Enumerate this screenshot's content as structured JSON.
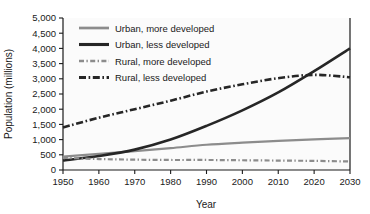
{
  "chart_data": {
    "type": "line",
    "title": "",
    "xlabel": "Year",
    "ylabel": "Population (millions)",
    "xlim": [
      1950,
      2030
    ],
    "ylim": [
      0,
      5000
    ],
    "xticks": [
      "1950",
      "1960",
      "1970",
      "1980",
      "1990",
      "2000",
      "2010",
      "2020",
      "2030"
    ],
    "yticks": [
      "0",
      "500",
      "1,000",
      "1,500",
      "2,000",
      "2,500",
      "3,000",
      "3,500",
      "4,000",
      "4,500",
      "5,000"
    ],
    "grid": false,
    "legend_position": "upper-left-inside",
    "x": [
      1950,
      1960,
      1970,
      1980,
      1990,
      2000,
      2010,
      2020,
      2030
    ],
    "series": [
      {
        "name": "Urban, more developed",
        "color": "#8c8c8c",
        "style": "solid",
        "width": 2.2,
        "values": [
          440,
          530,
          620,
          720,
          830,
          900,
          960,
          1010,
          1050
        ]
      },
      {
        "name": "Urban, less developed",
        "color": "#262626",
        "style": "solid",
        "width": 2.6,
        "values": [
          310,
          460,
          670,
          1000,
          1450,
          1960,
          2550,
          3250,
          4000
        ]
      },
      {
        "name": "Rural, more developed",
        "color": "#8c8c8c",
        "style": "dash-dot",
        "width": 2.2,
        "values": [
          400,
          360,
          340,
          330,
          330,
          320,
          310,
          300,
          280
        ]
      },
      {
        "name": "Rural, less developed",
        "color": "#262626",
        "style": "dash-dot",
        "width": 2.6,
        "values": [
          1400,
          1720,
          2000,
          2280,
          2580,
          2820,
          3020,
          3130,
          3050
        ]
      }
    ]
  },
  "legend": {
    "items": [
      {
        "label": "Urban, more developed"
      },
      {
        "label": "Urban, less developed"
      },
      {
        "label": "Rural, more developed"
      },
      {
        "label": "Rural, less developed"
      }
    ]
  },
  "axes": {
    "x_title": "Year",
    "y_title": "Population (millions)"
  }
}
